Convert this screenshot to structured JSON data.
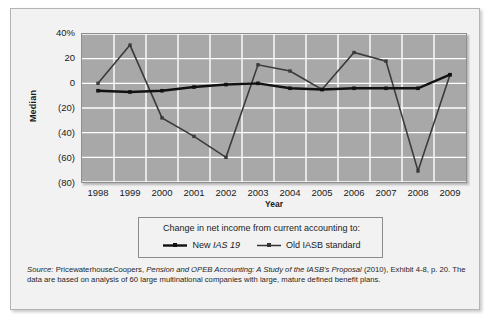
{
  "chart_data": {
    "type": "line",
    "title": "",
    "xlabel": "Year",
    "ylabel": "Median",
    "categories": [
      "1998",
      "1999",
      "2000",
      "2001",
      "2002",
      "2003",
      "2004",
      "2005",
      "2006",
      "2007",
      "2008",
      "2009"
    ],
    "ylim": [
      -80,
      40
    ],
    "yticks": [
      "40%",
      "20",
      "0",
      "(20)",
      "(40)",
      "(60)",
      "(80)"
    ],
    "ytick_values": [
      40,
      20,
      0,
      -20,
      -40,
      -60,
      -80
    ],
    "grid": true,
    "legend_position": "below-chart",
    "series": [
      {
        "name": "New IAS 19",
        "values": [
          -6,
          -7,
          -6,
          -3,
          -1,
          0,
          -4,
          -5,
          -4,
          -4,
          -4,
          7
        ]
      },
      {
        "name": "Old IASB standard",
        "values": [
          0,
          31,
          -28,
          -43,
          -60,
          15,
          10,
          -5,
          25,
          18,
          -71,
          7
        ]
      }
    ]
  },
  "axes": {
    "y_title": "Median",
    "x_title": "Year"
  },
  "legend": {
    "title": "Change in net income from current accounting to:",
    "entries": [
      {
        "label_prefix": "New ",
        "label_italic": "IAS 19",
        "label_suffix": "",
        "style": "thick-black"
      },
      {
        "label_prefix": "Old IASB standard",
        "label_italic": "",
        "label_suffix": "",
        "style": "thin-dark"
      }
    ]
  },
  "source": {
    "label": "Source:",
    "part1": " PricewaterhouseCoopers, ",
    "italic1": "Pension and OPEB Accounting: A Study of the IASB's Proposal",
    "part2": " (2010), Exhibit 4-8, p. 20. The data are based on analysis of 60 large multinational companies with large, mature defined benefit plans."
  },
  "colors": {
    "plot_background": "#a8a8a8",
    "gridlines": "#ffffff",
    "series_new": "#111111",
    "series_old": "#3a3a3a",
    "panel_background": "#f2f2f2"
  }
}
